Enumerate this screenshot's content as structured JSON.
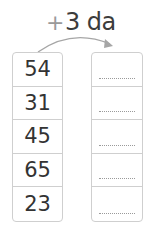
{
  "operation": {
    "plus": "+",
    "label": "3 da"
  },
  "numbers": [
    "54",
    "31",
    "45",
    "65",
    "23"
  ],
  "answers": [
    "",
    "",
    "",
    "",
    ""
  ],
  "colors": {
    "border": "#cfcfcf",
    "text": "#333333",
    "arc": "#9a9a9a"
  }
}
